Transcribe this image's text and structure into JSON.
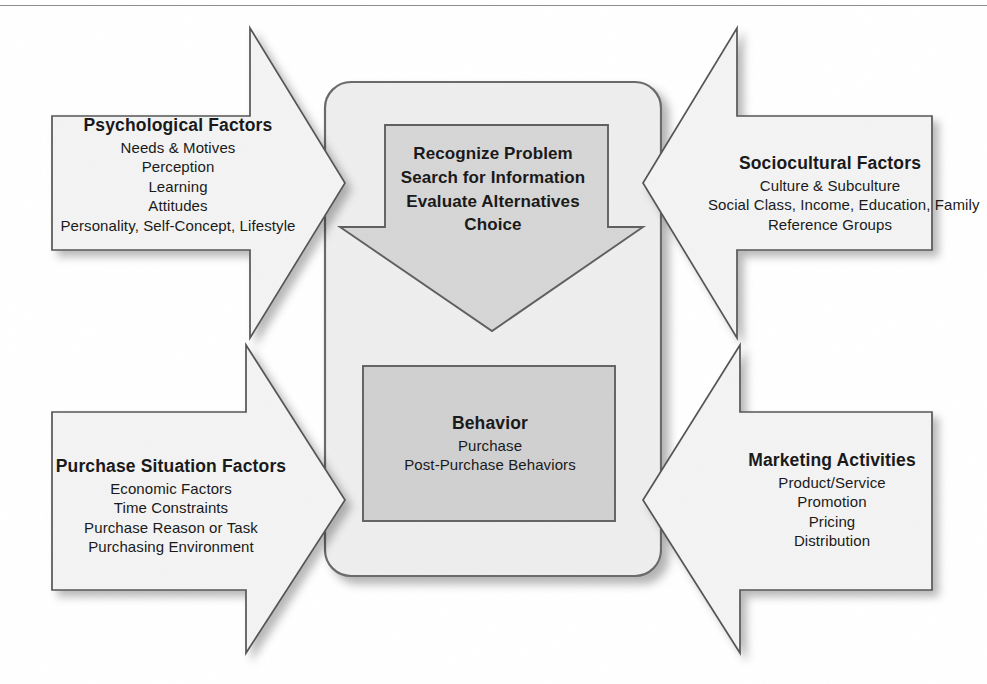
{
  "diagram": {
    "title_hidden": "",
    "colors": {
      "panel_fill": "#f2f2f2",
      "center_panel_fill": "#eeeeee",
      "process_fill": "#d4d4d4",
      "behavior_fill": "#cfcfcf",
      "stroke": "#5a5a5a",
      "text": "#1a1a1a",
      "background": "#ffffff"
    },
    "arrows": {
      "top_left": "arrow-right",
      "bottom_left": "arrow-right",
      "top_right": "arrow-left",
      "bottom_right": "arrow-left",
      "center": "arrow-down"
    }
  },
  "top_left": {
    "title": "Psychological Factors",
    "lines": [
      "Needs & Motives",
      "Perception",
      "Learning",
      "Attitudes",
      "Personality, Self-Concept, Lifestyle"
    ]
  },
  "top_right": {
    "title": "Sociocultural Factors",
    "lines": [
      "Culture & Subculture",
      "Social Class, Income, Education, Family",
      "Reference Groups"
    ]
  },
  "bottom_left": {
    "title": "Purchase Situation Factors",
    "lines": [
      "Economic Factors",
      "Time Constraints",
      "Purchase Reason or Task",
      "Purchasing Environment"
    ]
  },
  "bottom_right": {
    "title": "Marketing Activities",
    "lines": [
      "Product/Service",
      "Promotion",
      "Pricing",
      "Distribution"
    ]
  },
  "center_process": {
    "lines": [
      "Recognize Problem",
      "Search for Information",
      "Evaluate Alternatives",
      "Choice"
    ]
  },
  "behavior": {
    "title": "Behavior",
    "lines": [
      "Purchase",
      "Post-Purchase Behaviors"
    ]
  }
}
